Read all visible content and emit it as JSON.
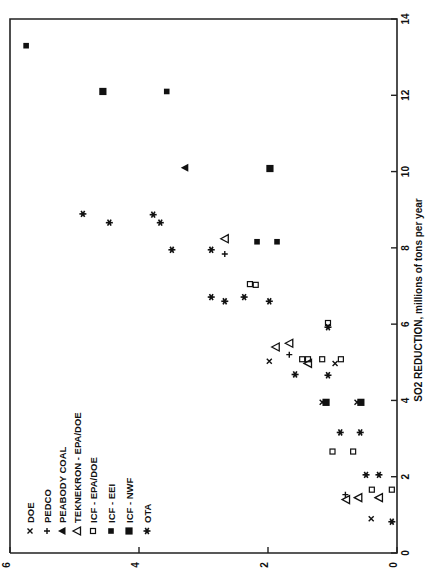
{
  "chart_data": {
    "type": "scatter",
    "title": "",
    "xlabel": "SO2 REDUCTION, millions of tons per year",
    "ylabel": "",
    "xlim": [
      0,
      14
    ],
    "ylim": [
      0,
      6
    ],
    "x_ticks": [
      "0",
      "2",
      "4",
      "6",
      "8",
      "10",
      "12",
      "14"
    ],
    "y_ticks": [
      "0",
      "2",
      "4",
      "6"
    ],
    "orientation": "rotated 90 degrees counter-clockwise",
    "legend_position": "upper-left (rotated)",
    "legend": [
      {
        "symbol": "x",
        "label": "DOE"
      },
      {
        "symbol": "+",
        "label": "PEDCO"
      },
      {
        "symbol": "filled-triangle",
        "label": "PEABODY COAL"
      },
      {
        "symbol": "open-triangle",
        "label": "TEKNEKRON - EPA/DOE"
      },
      {
        "symbol": "open-square",
        "label": "ICF - EPA/DOE"
      },
      {
        "symbol": "small-filled-square",
        "label": "ICF - EEI"
      },
      {
        "symbol": "large-filled-square",
        "label": "ICF - NWF"
      },
      {
        "symbol": "asterisk",
        "label": "OTA"
      }
    ],
    "series": [
      {
        "name": "DOE",
        "symbol": "x",
        "points": [
          [
            0.9,
            0.4
          ],
          [
            5.03,
            1.98
          ],
          [
            4.97,
            0.96
          ],
          [
            3.95,
            1.16
          ],
          [
            3.95,
            0.62
          ]
        ]
      },
      {
        "name": "PEDCO",
        "symbol": "+",
        "points": [
          [
            1.53,
            0.8
          ],
          [
            5.2,
            1.67
          ],
          [
            7.84,
            2.67
          ]
        ]
      },
      {
        "name": "PEABODY COAL",
        "symbol": "filled-triangle",
        "points": [
          [
            10.1,
            3.29
          ]
        ]
      },
      {
        "name": "TEKNEKRON - EPA/DOE",
        "symbol": "open-triangle",
        "points": [
          [
            1.4,
            0.79
          ],
          [
            1.45,
            0.6
          ],
          [
            1.45,
            0.28
          ],
          [
            5.4,
            1.88
          ],
          [
            5.5,
            1.67
          ],
          [
            4.97,
            1.38
          ],
          [
            8.24,
            2.67
          ]
        ]
      },
      {
        "name": "ICF - EPA/DOE",
        "symbol": "open-square",
        "points": [
          [
            2.66,
            1.0
          ],
          [
            2.66,
            0.68
          ],
          [
            1.66,
            0.39
          ],
          [
            1.66,
            0.08
          ],
          [
            5.08,
            1.47
          ],
          [
            5.08,
            1.38
          ],
          [
            5.08,
            1.16
          ],
          [
            5.08,
            0.87
          ],
          [
            6.03,
            1.07
          ],
          [
            7.05,
            2.28
          ],
          [
            7.03,
            2.19
          ]
        ]
      },
      {
        "name": "ICF - EEI",
        "symbol": "small-filled-square",
        "points": [
          [
            13.3,
            5.75
          ],
          [
            12.1,
            3.57
          ],
          [
            8.16,
            2.17
          ],
          [
            8.16,
            1.86
          ]
        ]
      },
      {
        "name": "ICF - NWF",
        "symbol": "large-filled-square",
        "points": [
          [
            12.1,
            4.56
          ],
          [
            10.08,
            1.97
          ],
          [
            3.95,
            1.1
          ],
          [
            3.95,
            0.56
          ]
        ]
      },
      {
        "name": "OTA",
        "symbol": "asterisk",
        "points": [
          [
            0.82,
            0.08
          ],
          [
            2.05,
            0.48
          ],
          [
            2.05,
            0.28
          ],
          [
            3.16,
            0.88
          ],
          [
            3.16,
            0.57
          ],
          [
            4.68,
            1.58
          ],
          [
            4.66,
            1.07
          ],
          [
            5.92,
            1.07
          ],
          [
            6.71,
            2.88
          ],
          [
            6.6,
            2.67
          ],
          [
            6.71,
            2.37
          ],
          [
            6.6,
            1.98
          ],
          [
            7.95,
            3.49
          ],
          [
            7.95,
            2.88
          ],
          [
            8.89,
            4.87
          ],
          [
            8.66,
            4.46
          ],
          [
            8.87,
            3.78
          ],
          [
            8.66,
            3.67
          ]
        ]
      }
    ]
  }
}
